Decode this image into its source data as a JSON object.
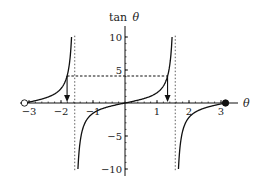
{
  "chart_data": {
    "type": "line",
    "title": "",
    "xlabel": "θ",
    "ylabel": "tan θ",
    "ylabel_parts": {
      "fn": "tan",
      "var": "θ"
    },
    "function": "tan(theta)",
    "xlim": [
      -3.1416,
      3.1416
    ],
    "ylim": [
      -10,
      10
    ],
    "x_ticks": [
      -3,
      -2,
      -1,
      1,
      2,
      3
    ],
    "x_tick_labels": [
      "−3",
      "−2",
      "−1",
      "1",
      "2",
      "3"
    ],
    "x_minor_tick_step": 0.2,
    "y_ticks": [
      -10,
      -5,
      5,
      10
    ],
    "y_tick_labels": [
      "−10",
      "−5",
      "5",
      "10"
    ],
    "y_minor_tick_step": 1,
    "grid": false,
    "legend": null,
    "asymptotes_x": [
      -1.5708,
      1.5708
    ],
    "asymptote_style": "dotted",
    "endpoints": [
      {
        "x": -3.1416,
        "y": 0,
        "style": "open-circle"
      },
      {
        "x": 3.1416,
        "y": 0,
        "style": "filled-circle"
      }
    ],
    "level_line": {
      "y": 4.1,
      "x_from": -1.81,
      "x_to": 1.33,
      "style": "dashed"
    },
    "arrows": [
      {
        "x": -1.81,
        "from_y": 4.1,
        "to_y": 0,
        "direction": "down"
      },
      {
        "x": 1.33,
        "from_y": 4.1,
        "to_y": 0,
        "direction": "down"
      }
    ],
    "series": [
      {
        "name": "tan θ branch (−π, −π/2)",
        "x_range": [
          -3.1416,
          -1.6704
        ]
      },
      {
        "name": "tan θ branch (−π/2, π/2)",
        "x_range": [
          -1.4712,
          1.4712
        ]
      },
      {
        "name": "tan θ branch (π/2, π)",
        "x_range": [
          1.6704,
          3.1416
        ]
      }
    ]
  },
  "layout": {
    "origin_px": [
      125,
      103
    ],
    "x_scale_px": 32,
    "y_scale_px": 6.6,
    "x_axis_extent_px": [
      20,
      238
    ],
    "y_axis_extent_px": [
      26,
      176
    ],
    "line_color": "#111111",
    "guide_color": "#333333"
  }
}
